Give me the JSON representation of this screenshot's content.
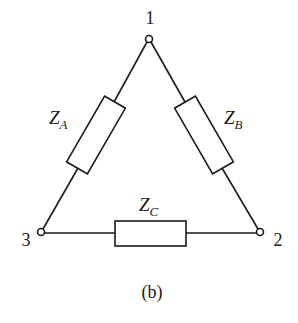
{
  "diagram": {
    "type": "delta-impedance-network",
    "caption": "(b)",
    "nodes": [
      {
        "id": "1",
        "label": "1"
      },
      {
        "id": "2",
        "label": "2"
      },
      {
        "id": "3",
        "label": "3"
      }
    ],
    "impedances": [
      {
        "id": "ZA",
        "symbol": "Z",
        "subscript": "A",
        "between": [
          "1",
          "3"
        ]
      },
      {
        "id": "ZB",
        "symbol": "Z",
        "subscript": "B",
        "between": [
          "1",
          "2"
        ]
      },
      {
        "id": "ZC",
        "symbol": "Z",
        "subscript": "C",
        "between": [
          "3",
          "2"
        ]
      }
    ],
    "colors": {
      "stroke": "#1a1a1a",
      "background": "#ffffff"
    }
  }
}
